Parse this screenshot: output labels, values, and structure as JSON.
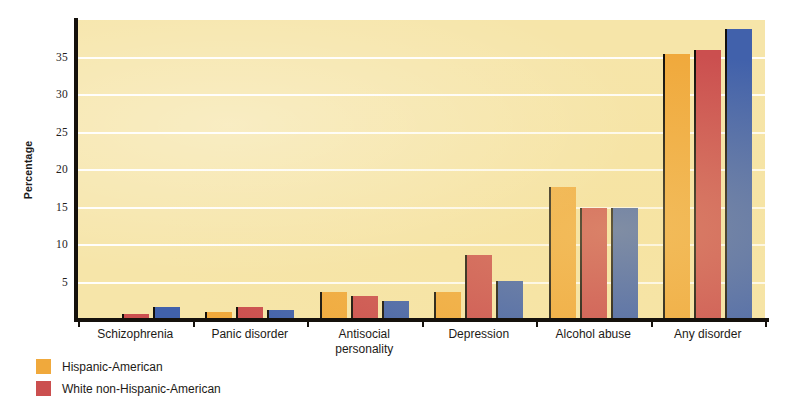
{
  "chart_data": {
    "type": "bar",
    "title": "",
    "xlabel": "",
    "ylabel": "Percentage",
    "ylim": [
      0,
      40
    ],
    "yticks": [
      5,
      10,
      15,
      20,
      25,
      30,
      35
    ],
    "ytick_labels": [
      "5",
      "10",
      "15",
      "20",
      "25",
      "30",
      "35"
    ],
    "grid": true,
    "legend_position": "bottom-left",
    "categories": [
      "Schizophrenia",
      "Panic disorder",
      "Antisocial personality",
      "Depression",
      "Alcohol abuse",
      "Any disorder"
    ],
    "category_lines": [
      [
        "Schizophrenia"
      ],
      [
        "Panic disorder"
      ],
      [
        "Antisocial",
        "personality"
      ],
      [
        "Depression"
      ],
      [
        "Alcohol abuse"
      ],
      [
        "Any disorder"
      ]
    ],
    "series": [
      {
        "name": "Hispanic-American",
        "color": "#f0a93c",
        "values": [
          0.2,
          1.1,
          3.7,
          3.7,
          17.7,
          35.5
        ]
      },
      {
        "name": "White non-Hispanic-American",
        "color": "#cb4f4f",
        "values": [
          0.8,
          1.7,
          3.2,
          8.7,
          15.0,
          36.0
        ]
      },
      {
        "name": "",
        "color": "#4161ab",
        "values": [
          1.7,
          1.3,
          2.6,
          5.2,
          14.9,
          38.8
        ]
      }
    ]
  },
  "legend": {
    "entries": [
      {
        "label": "Hispanic-American",
        "color": "#f0a93c"
      },
      {
        "label": "White non-Hispanic-American",
        "color": "#cb4f4f"
      }
    ]
  },
  "colors": {
    "plot_background": "#f6e5a9",
    "gridline": "#ffffff",
    "axis": "#15110c",
    "page_background": "#ffffff",
    "series_1": "#f0a93c",
    "series_2": "#cb4f4f",
    "series_3": "#4161ab"
  }
}
